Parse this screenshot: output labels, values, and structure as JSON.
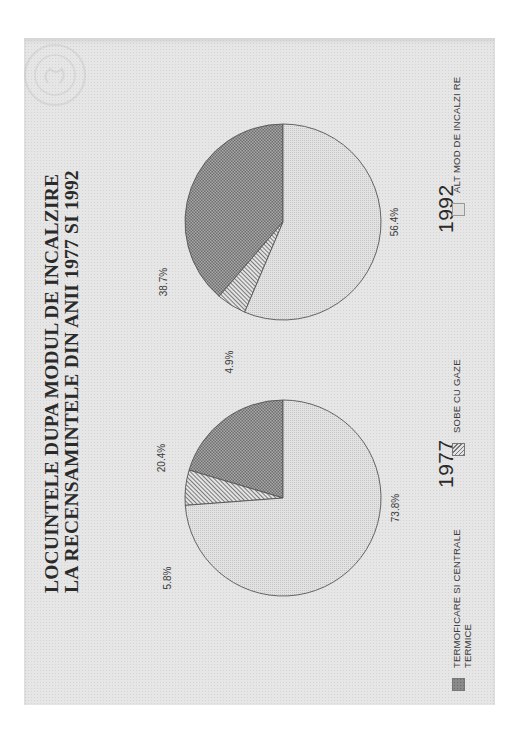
{
  "title": {
    "line1": "LOCUINTELE DUPA MODUL DE INCALZIRE",
    "line2": "LA RECENSAMINTELE DIN ANII 1977 SI 1992"
  },
  "pies": [
    {
      "year": "1977",
      "slices": [
        {
          "label": "TERMOFICARE SI CENTRALE TERMICE",
          "value": 20.4,
          "text": "20.4%"
        },
        {
          "label": "SOBE CU GAZE",
          "value": 5.8,
          "text": "5.8%"
        },
        {
          "label": "ALT MOD DE INCALZIRE",
          "value": 73.8,
          "text": "73.8%"
        }
      ]
    },
    {
      "year": "1992",
      "slices": [
        {
          "label": "TERMOFICARE SI CENTRALE TERMICE",
          "value": 38.7,
          "text": "38.7%"
        },
        {
          "label": "SOBE CU GAZE",
          "value": 4.9,
          "text": "4.9%"
        },
        {
          "label": "ALT MOD DE INCALZIRE",
          "value": 56.4,
          "text": "56.4%"
        }
      ]
    }
  ],
  "legend": [
    {
      "label_line1": "TERMOFICARE SI CENTRALE",
      "label_line2": "TERMICE",
      "pattern": "crosshatch"
    },
    {
      "label_line1": "SOBE CU GAZE",
      "label_line2": "",
      "pattern": "diagonal"
    },
    {
      "label_line1": "ALT MOD DE INCALZI RE",
      "label_line2": "",
      "pattern": "light-dots"
    }
  ],
  "colors": {
    "page": "#e6e6e6",
    "termoficare": "#8c8c8c",
    "sobe": "#cfcfcf",
    "alt": "#dedede",
    "outline": "#555555"
  },
  "chart_data": {
    "type": "pie",
    "title": "LOCUINTELE DUPA MODUL DE INCALZIRE LA RECENSAMINTELE DIN ANII 1977 SI 1992",
    "categories": [
      "TERMOFICARE SI CENTRALE TERMICE",
      "SOBE CU GAZE",
      "ALT MOD DE INCALZIRE"
    ],
    "series": [
      {
        "name": "1977",
        "values": [
          20.4,
          5.8,
          73.8
        ]
      },
      {
        "name": "1992",
        "values": [
          38.7,
          4.9,
          56.4
        ]
      }
    ],
    "units": "%",
    "legend_position": "bottom",
    "orientation_note": "page rotated 90 degrees counter-clockwise"
  }
}
